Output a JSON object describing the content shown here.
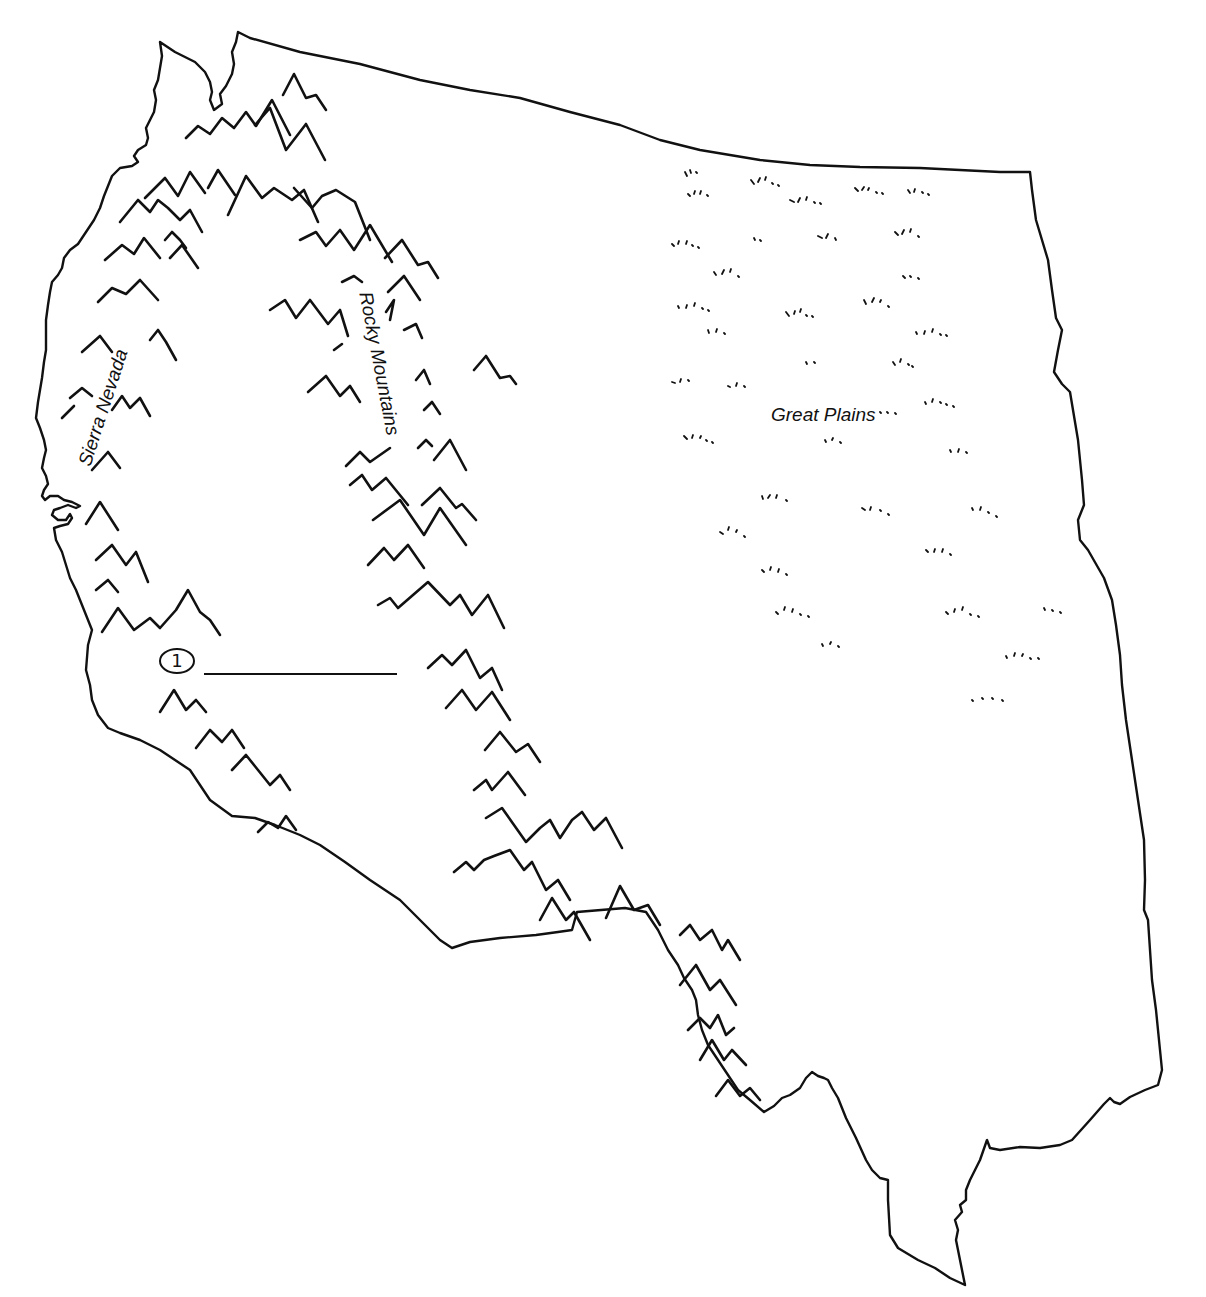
{
  "map": {
    "type": "outline map",
    "region": "Western United States",
    "labels": {
      "sierra_nevada": "Sierra Nevada",
      "rocky_mountains": "Rocky Mountains",
      "great_plains": "Great Plains"
    },
    "markers": [
      {
        "id": "1",
        "label": "1"
      }
    ],
    "colors": {
      "ink": "#111111",
      "background": "#ffffff"
    }
  }
}
